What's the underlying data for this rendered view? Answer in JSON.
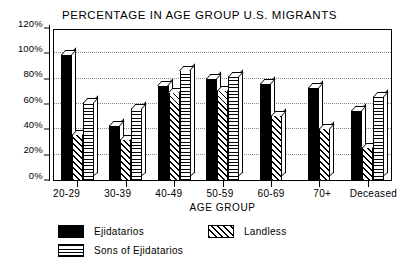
{
  "chart_data": {
    "type": "bar",
    "title": "PERCENTAGE IN AGE GROUP U.S. MIGRANTS",
    "xlabel": "AGE GROUP",
    "ylabel": "",
    "ylim": [
      0,
      120
    ],
    "ytick_labels": [
      "120%",
      "100%",
      "80%",
      "60%",
      "40%",
      "20%",
      "0%"
    ],
    "ytick_values": [
      120,
      100,
      80,
      60,
      40,
      20,
      0
    ],
    "grid": true,
    "legend_position": "bottom-left",
    "categories": [
      "20-29",
      "30-39",
      "40-49",
      "50-59",
      "60-69",
      "70+",
      "Deceased"
    ],
    "series": [
      {
        "name": "Ejidatarios",
        "pattern": "solid",
        "values": [
          100,
          44,
          76,
          81,
          77,
          74,
          56
        ]
      },
      {
        "name": "Landless",
        "pattern": "diagonal-hatch",
        "values": [
          37,
          33,
          70,
          72,
          52,
          42,
          27
        ]
      },
      {
        "name": "Sons of Ejidatarios",
        "pattern": "cross-hatch",
        "values": [
          62,
          58,
          88,
          83,
          null,
          null,
          67
        ]
      }
    ]
  },
  "legend": {
    "items": [
      {
        "label": "Ejidatarios",
        "pattern": "solid"
      },
      {
        "label": "Landless",
        "pattern": "diagonal-hatch"
      },
      {
        "label": "Sons of Ejidatarios",
        "pattern": "cross-hatch"
      }
    ]
  }
}
